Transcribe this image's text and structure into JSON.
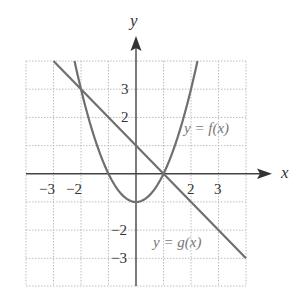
{
  "chart_data": {
    "type": "line",
    "title": "",
    "xlabel": "x",
    "ylabel": "y",
    "xlim": [
      -4,
      4
    ],
    "ylim": [
      -4,
      4
    ],
    "grid": true,
    "grid_style": "dotted",
    "x_ticks_labeled": [
      -3,
      -2,
      2,
      3
    ],
    "y_ticks_labeled": [
      3,
      2,
      -2,
      -3
    ],
    "tick_labels": {
      "x": [
        "−3",
        "−2",
        "2",
        "3"
      ],
      "y": [
        "3",
        "2",
        "−2",
        "−3"
      ]
    },
    "series": [
      {
        "name": "y = f(x)",
        "formula": "f(x) = x^2 - 1",
        "x": [
          -2.236,
          -2,
          -1,
          0,
          1,
          2,
          2.236
        ],
        "y": [
          4,
          3,
          0,
          -1,
          0,
          3,
          4
        ]
      },
      {
        "name": "y = g(x)",
        "formula": "g(x) = -x + 1",
        "x": [
          -3,
          -2,
          1,
          4
        ],
        "y": [
          4,
          3,
          0,
          -3
        ]
      }
    ],
    "intersections": [
      [
        -2,
        3
      ],
      [
        1,
        0
      ]
    ],
    "annotations": [
      "y = f(x)",
      "y = g(x)"
    ]
  },
  "labels": {
    "x_axis": "x",
    "y_axis": "y",
    "f_label": "y = f(x)",
    "g_label": "y = g(x)",
    "x_tick_m3": "−3",
    "x_tick_m2": "−2",
    "x_tick_2": "2",
    "x_tick_3": "3",
    "y_tick_3": "3",
    "y_tick_2": "2",
    "y_tick_m2": "−2",
    "y_tick_m3": "−3"
  },
  "colors": {
    "axis": "#444444",
    "curve": "#777777",
    "grid": "#bbbbbb",
    "text": "#333333"
  }
}
